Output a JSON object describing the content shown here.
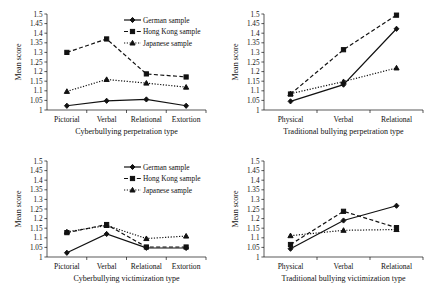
{
  "figure": {
    "name": "four-panel-line-chart",
    "axis_title_y": "Mean score",
    "legend": [
      {
        "key": "german",
        "label": "German sample",
        "style": "solid",
        "marker": "diamond"
      },
      {
        "key": "hongkong",
        "label": "Hong Kong sample",
        "style": "dashed",
        "marker": "square"
      },
      {
        "key": "japanese",
        "label": "Japanese sample",
        "style": "dotted",
        "marker": "triangle"
      }
    ],
    "y_ticks": [
      "1",
      "1.05",
      "1.1",
      "1.15",
      "1.2",
      "1.25",
      "1.3",
      "1.35",
      "1.4",
      "1.45",
      "1.5"
    ]
  },
  "chart_data": [
    {
      "id": "cyberbullying-perpetration",
      "type": "line",
      "title": "",
      "xlabel": "Cyberbullying perpetration type",
      "ylabel": "Mean score",
      "ylim": [
        1,
        1.5
      ],
      "ytick_step": 0.05,
      "grid": false,
      "legend_position": "top-right",
      "categories": [
        "Pictorial",
        "Verbal",
        "Relational",
        "Extortion"
      ],
      "series": [
        {
          "name": "German sample",
          "values": [
            1.022,
            1.048,
            1.055,
            1.022
          ]
        },
        {
          "name": "Hong Kong sample",
          "values": [
            1.3,
            1.37,
            1.188,
            1.172
          ]
        },
        {
          "name": "Japanese sample",
          "values": [
            1.097,
            1.159,
            1.14,
            1.119
          ]
        }
      ]
    },
    {
      "id": "traditional-bullying-perpetration",
      "type": "line",
      "title": "",
      "xlabel": "Traditional bullying perpetration type",
      "ylabel": "Mean score",
      "ylim": [
        1,
        1.5
      ],
      "ytick_step": 0.05,
      "grid": false,
      "legend_position": "none",
      "categories": [
        "Physical",
        "Verbal",
        "Relational"
      ],
      "series": [
        {
          "name": "German sample",
          "values": [
            1.045,
            1.132,
            1.423
          ]
        },
        {
          "name": "Hong Kong sample",
          "values": [
            1.083,
            1.314,
            1.494
          ]
        },
        {
          "name": "Japanese sample",
          "values": [
            1.085,
            1.148,
            1.219
          ]
        }
      ]
    },
    {
      "id": "cyberbullying-victimization",
      "type": "line",
      "title": "",
      "xlabel": "Cyberbullying victimization type",
      "ylabel": "Mean score",
      "ylim": [
        1,
        1.5
      ],
      "ytick_step": 0.05,
      "grid": false,
      "legend_position": "top-right",
      "categories": [
        "Pictorial",
        "Verbal",
        "Relational",
        "Extortion"
      ],
      "series": [
        {
          "name": "German sample",
          "values": [
            1.022,
            1.12,
            1.048,
            1.047
          ]
        },
        {
          "name": "Hong Kong sample",
          "values": [
            1.127,
            1.169,
            1.052,
            1.052
          ]
        },
        {
          "name": "Japanese sample",
          "values": [
            1.131,
            1.164,
            1.096,
            1.109
          ]
        }
      ]
    },
    {
      "id": "traditional-bullying-victimization",
      "type": "line",
      "title": "",
      "xlabel": "Traditional bullying victimization type",
      "ylabel": "Mean score",
      "ylim": [
        1,
        1.5
      ],
      "ytick_step": 0.05,
      "grid": false,
      "legend_position": "none",
      "categories": [
        "Physical",
        "Verbal",
        "Relational"
      ],
      "series": [
        {
          "name": "German sample",
          "values": [
            1.043,
            1.19,
            1.267
          ]
        },
        {
          "name": "Hong Kong sample",
          "values": [
            1.065,
            1.238,
            1.153
          ]
        },
        {
          "name": "Japanese sample",
          "values": [
            1.111,
            1.139,
            1.143
          ]
        }
      ]
    }
  ]
}
